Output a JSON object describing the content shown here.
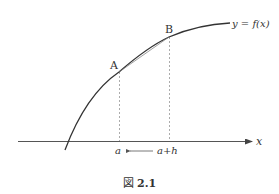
{
  "figure": {
    "caption_prefix": "図",
    "caption_number": "2.1",
    "curve_label": "y = f(x)",
    "point_a_label": "A",
    "point_b_label": "B",
    "x_axis_label": "x",
    "tick_a_label": "a",
    "tick_ah_label": "a+h",
    "arrow_direction": "left",
    "colors": {
      "curve": "#333333",
      "axis": "#555555",
      "dashed": "#888888",
      "secant": "#777777"
    }
  }
}
